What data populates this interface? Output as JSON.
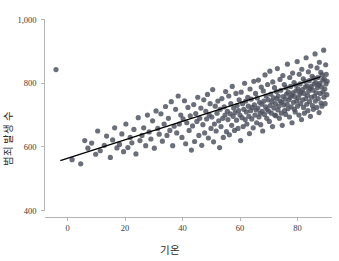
{
  "chart_data": {
    "type": "scatter",
    "title": "",
    "xlabel": "기온",
    "ylabel": "범죄 발생 수",
    "xlim": [
      -8,
      92
    ],
    "ylim": [
      380,
      1030
    ],
    "xticks": [
      "0",
      "20",
      "40",
      "60",
      "80"
    ],
    "xtick_values": [
      0,
      20,
      40,
      60,
      80
    ],
    "yticks": [
      "400",
      "600",
      "800",
      "1,000"
    ],
    "ytick_values": [
      400,
      600,
      800,
      1000
    ],
    "grid": false,
    "legend": null,
    "point_color": "#4a4f5c",
    "point_size": 2.6,
    "point_opacity": 0.82,
    "line_color": "#000000",
    "axis_color": "#b5b5b5",
    "trendline": {
      "type": "linear",
      "x_start": -2.5,
      "y_start": 557,
      "x_end": 88,
      "y_end": 820
    },
    "x": [
      -4.0,
      1.6,
      4.6,
      6.0,
      7.1,
      8.4,
      9.8,
      10.5,
      11.4,
      12.8,
      13.6,
      14.9,
      15.7,
      16.4,
      17.2,
      18.1,
      18.9,
      19.5,
      20.3,
      21.0,
      21.8,
      22.4,
      23.1,
      23.8,
      24.6,
      25.2,
      25.9,
      26.5,
      27.2,
      27.8,
      28.4,
      29.0,
      29.6,
      30.2,
      30.8,
      31.4,
      31.9,
      32.5,
      33.0,
      33.6,
      34.1,
      34.6,
      35.1,
      35.6,
      36.1,
      36.6,
      37.1,
      37.6,
      38.0,
      38.5,
      38.9,
      39.4,
      39.8,
      40.2,
      40.7,
      41.1,
      41.5,
      41.9,
      42.3,
      42.7,
      43.1,
      43.5,
      43.9,
      44.2,
      44.6,
      45.0,
      45.3,
      45.7,
      46.0,
      46.4,
      46.7,
      47.1,
      47.4,
      47.7,
      48.1,
      48.4,
      48.7,
      49.0,
      49.3,
      49.6,
      49.9,
      50.2,
      50.5,
      50.8,
      51.1,
      51.4,
      51.7,
      52.0,
      52.3,
      52.6,
      52.9,
      53.1,
      53.4,
      53.7,
      54.0,
      54.2,
      54.5,
      54.8,
      55.0,
      55.3,
      55.6,
      55.8,
      56.1,
      56.3,
      56.6,
      56.8,
      57.1,
      57.3,
      57.6,
      57.8,
      58.1,
      58.3,
      58.6,
      58.8,
      59.0,
      59.3,
      59.5,
      59.7,
      60.0,
      60.2,
      60.4,
      60.7,
      60.9,
      61.1,
      61.3,
      61.6,
      61.8,
      62.0,
      62.2,
      62.4,
      62.7,
      62.9,
      63.1,
      63.3,
      63.5,
      63.7,
      63.9,
      64.1,
      64.3,
      64.6,
      64.8,
      65.0,
      65.2,
      65.4,
      65.6,
      65.8,
      66.0,
      66.2,
      66.4,
      66.6,
      66.8,
      67.0,
      67.2,
      67.4,
      67.6,
      67.7,
      67.9,
      68.1,
      68.3,
      68.5,
      68.7,
      68.9,
      69.1,
      69.3,
      69.4,
      69.6,
      69.8,
      70.0,
      70.2,
      70.4,
      70.5,
      70.7,
      70.9,
      71.1,
      71.3,
      71.4,
      71.6,
      71.8,
      72.0,
      72.1,
      72.3,
      72.5,
      72.7,
      72.8,
      73.0,
      73.2,
      73.3,
      73.5,
      73.7,
      73.9,
      74.0,
      74.2,
      74.4,
      74.5,
      74.7,
      74.9,
      75.0,
      75.2,
      75.4,
      75.5,
      75.7,
      75.9,
      76.0,
      76.2,
      76.4,
      76.5,
      76.7,
      76.8,
      77.0,
      77.2,
      77.3,
      77.5,
      77.6,
      77.8,
      78.0,
      78.1,
      78.3,
      78.4,
      78.6,
      78.8,
      78.9,
      79.1,
      79.2,
      79.4,
      79.5,
      79.7,
      79.9,
      80.0,
      80.2,
      80.3,
      80.5,
      80.6,
      80.8,
      80.9,
      81.1,
      81.2,
      81.4,
      81.5,
      81.7,
      81.8,
      82.0,
      82.1,
      82.3,
      82.4,
      82.6,
      82.7,
      82.9,
      83.0,
      83.2,
      83.3,
      83.5,
      83.6,
      83.8,
      83.9,
      84.1,
      84.2,
      84.4,
      84.5,
      84.6,
      84.8,
      84.9,
      85.1,
      85.2,
      85.4,
      85.5,
      85.7,
      85.8,
      85.9,
      86.1,
      86.2,
      86.4,
      86.5,
      86.7,
      86.8,
      86.9,
      87.1,
      87.2,
      87.4,
      87.5,
      87.6,
      87.8,
      87.9,
      88.1,
      88.2,
      88.4,
      88.5,
      88.6,
      88.8,
      88.9,
      89.1,
      89.2,
      89.3,
      89.5,
      89.6,
      89.8,
      89.9,
      90.0,
      90.2,
      90.3
    ],
    "y": [
      843,
      560,
      547,
      620,
      596,
      612,
      577,
      650,
      588,
      605,
      634,
      567,
      622,
      660,
      597,
      608,
      641,
      585,
      672,
      598,
      630,
      613,
      655,
      578,
      692,
      620,
      636,
      660,
      604,
      700,
      647,
      625,
      682,
      596,
      713,
      658,
      640,
      704,
      618,
      672,
      727,
      636,
      690,
      652,
      742,
      604,
      665,
      718,
      644,
      760,
      672,
      700,
      630,
      688,
      745,
      610,
      676,
      724,
      652,
      698,
      590,
      666,
      733,
      617,
      705,
      680,
      756,
      636,
      690,
      722,
      605,
      670,
      748,
      644,
      712,
      688,
      765,
      628,
      700,
      736,
      658,
      694,
      780,
      616,
      672,
      728,
      650,
      706,
      744,
      682,
      598,
      718,
      664,
      752,
      690,
      630,
      726,
      700,
      774,
      648,
      712,
      686,
      760,
      638,
      704,
      736,
      668,
      790,
      696,
      722,
      652,
      708,
      768,
      684,
      730,
      658,
      714,
      748,
      700,
      620,
      772,
      692,
      736,
      664,
      718,
      800,
      686,
      744,
      710,
      672,
      756,
      728,
      696,
      642,
      782,
      714,
      750,
      688,
      724,
      660,
      806,
      732,
      700,
      768,
      716,
      676,
      754,
      722,
      810,
      694,
      740,
      706,
      670,
      788,
      734,
      712,
      650,
      776,
      744,
      702,
      826,
      726,
      760,
      690,
      718,
      796,
      748,
      712,
      680,
      838,
      730,
      766,
      706,
      742,
      664,
      804,
      754,
      722,
      786,
      700,
      736,
      698,
      774,
      752,
      846,
      716,
      760,
      728,
      690,
      812,
      744,
      778,
      706,
      740,
      668,
      824,
      758,
      732,
      796,
      714,
      750,
      702,
      786,
      766,
      734,
      860,
      720,
      772,
      748,
      694,
      818,
      756,
      790,
      726,
      762,
      676,
      832,
      770,
      740,
      802,
      718,
      758,
      710,
      794,
      776,
      744,
      868,
      728,
      782,
      754,
      700,
      828,
      766,
      798,
      736,
      772,
      686,
      844,
      780,
      748,
      814,
      724,
      768,
      706,
      806,
      788,
      752,
      880,
      734,
      792,
      762,
      714,
      836,
      776,
      808,
      742,
      784,
      696,
      854,
      790,
      756,
      822,
      730,
      778,
      718,
      816,
      798,
      760,
      892,
      744,
      802,
      770,
      724,
      848,
      786,
      818,
      752,
      794,
      708,
      866,
      800,
      768,
      834,
      738,
      788,
      728,
      826,
      810,
      772,
      904,
      756,
      814,
      782,
      736,
      858,
      798,
      828,
      764,
      806,
      720,
      878,
      812,
      780,
      846,
      750
    ]
  }
}
